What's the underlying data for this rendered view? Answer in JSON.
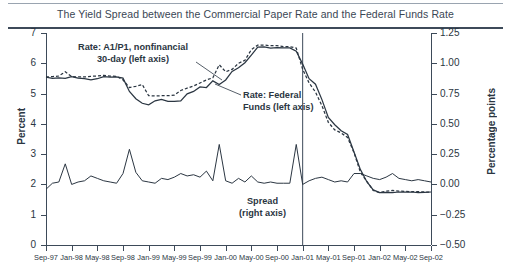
{
  "title": "The Yield Spread between the Commercial Paper Rate and the Federal Funds Rate",
  "axes": {
    "left_title": "Percent",
    "right_title": "Percentage points",
    "left_ticks": [
      "0",
      "1",
      "2",
      "3",
      "4",
      "5",
      "6",
      "7"
    ],
    "right_ticks": [
      "−0.50",
      "−0.25",
      "0.00",
      "0.25",
      "0.50",
      "0.75",
      "1.00",
      "1.25"
    ],
    "x_ticks": [
      "Sep-97",
      "Jan-98",
      "May-98",
      "Sep-98",
      "Jan-99",
      "May-99",
      "Sep-99",
      "Jan-00",
      "May-00",
      "Sep-00",
      "Jan-01",
      "May-01",
      "Sep-01",
      "Jan-02",
      "May-02",
      "Sep-02"
    ]
  },
  "annotations": {
    "cp_line1": "Rate: A1/P1, nonfinancial",
    "cp_line2": "30-day (left axis)",
    "ff_line1": "Rate: Federal",
    "ff_line2": "Funds (left axis)",
    "spread_line1": "Spread",
    "spread_line2": "(right axis)"
  },
  "colors": {
    "line": "#2b3642",
    "axis": "#3d4a59",
    "title": "#3a4654"
  },
  "chart_data": {
    "type": "line",
    "title": "The Yield Spread between the Commercial Paper Rate and the Federal Funds Rate",
    "xlabel": "",
    "ylabel": "Percent",
    "y2label": "Percentage points",
    "ylim": [
      0,
      7
    ],
    "y2lim": [
      -0.5,
      1.25
    ],
    "grid": false,
    "legend": "annotations-inline",
    "vline": {
      "x": "Jan-01",
      "label": ""
    },
    "x": [
      "Sep-97",
      "Oct-97",
      "Nov-97",
      "Dec-97",
      "Jan-98",
      "Feb-98",
      "Mar-98",
      "Apr-98",
      "May-98",
      "Jun-98",
      "Jul-98",
      "Aug-98",
      "Sep-98",
      "Oct-98",
      "Nov-98",
      "Dec-98",
      "Jan-99",
      "Feb-99",
      "Mar-99",
      "Apr-99",
      "May-99",
      "Jun-99",
      "Jul-99",
      "Aug-99",
      "Sep-99",
      "Oct-99",
      "Nov-99",
      "Dec-99",
      "Jan-00",
      "Feb-00",
      "Mar-00",
      "Apr-00",
      "May-00",
      "Jun-00",
      "Jul-00",
      "Aug-00",
      "Sep-00",
      "Oct-00",
      "Nov-00",
      "Dec-00",
      "Jan-01",
      "Feb-01",
      "Mar-01",
      "Apr-01",
      "May-01",
      "Jun-01",
      "Jul-01",
      "Aug-01",
      "Sep-01",
      "Oct-01",
      "Nov-01",
      "Dec-01",
      "Jan-02",
      "Feb-02",
      "Mar-02",
      "Apr-02",
      "May-02",
      "Jun-02",
      "Jul-02",
      "Aug-02",
      "Sep-02"
    ],
    "series": [
      {
        "name": "Rate: A1/P1, nonfinancial 30-day (left axis)",
        "style": "dashed",
        "axis": "left",
        "units": "percent",
        "values": [
          5.55,
          5.56,
          5.58,
          5.72,
          5.56,
          5.55,
          5.55,
          5.57,
          5.58,
          5.6,
          5.58,
          5.57,
          5.45,
          5.2,
          5.24,
          5.3,
          4.93,
          4.92,
          4.93,
          4.93,
          4.95,
          5.1,
          5.18,
          5.25,
          5.35,
          5.45,
          5.52,
          5.95,
          5.72,
          5.8,
          6.0,
          6.1,
          6.45,
          6.6,
          6.6,
          6.58,
          6.58,
          6.55,
          6.55,
          6.5,
          5.8,
          5.35,
          5.05,
          4.6,
          4.05,
          3.8,
          3.7,
          3.55,
          3.05,
          2.4,
          2.1,
          1.8,
          1.73,
          1.78,
          1.8,
          1.78,
          1.77,
          1.76,
          1.76,
          1.75,
          1.74
        ]
      },
      {
        "name": "Rate: Federal Funds (left axis)",
        "style": "solid",
        "axis": "left",
        "units": "percent",
        "values": [
          5.54,
          5.5,
          5.52,
          5.5,
          5.56,
          5.51,
          5.49,
          5.45,
          5.49,
          5.56,
          5.54,
          5.55,
          5.51,
          5.07,
          4.83,
          4.68,
          4.63,
          4.76,
          4.81,
          4.74,
          4.74,
          4.76,
          4.99,
          5.07,
          5.22,
          5.2,
          5.42,
          5.3,
          5.45,
          5.73,
          5.85,
          6.02,
          6.27,
          6.53,
          6.54,
          6.5,
          6.52,
          6.51,
          6.51,
          6.4,
          5.98,
          5.49,
          5.31,
          4.8,
          4.21,
          3.97,
          3.77,
          3.65,
          3.07,
          2.49,
          2.09,
          1.82,
          1.73,
          1.74,
          1.73,
          1.75,
          1.75,
          1.75,
          1.73,
          1.74,
          1.75
        ]
      },
      {
        "name": "Spread (right axis)",
        "style": "solid",
        "axis": "right",
        "units": "percentage points",
        "values": [
          -0.04,
          0.01,
          0.02,
          0.17,
          0.0,
          0.02,
          0.03,
          0.07,
          0.05,
          0.03,
          0.02,
          0.01,
          0.09,
          0.29,
          0.1,
          0.03,
          0.02,
          0.01,
          0.05,
          0.04,
          0.06,
          0.09,
          0.07,
          0.08,
          0.06,
          0.11,
          0.03,
          0.33,
          0.03,
          0.01,
          0.05,
          0.02,
          0.07,
          0.02,
          0.01,
          0.02,
          0.01,
          0.01,
          0.01,
          0.33,
          0.0,
          0.03,
          0.05,
          0.06,
          0.04,
          0.02,
          0.03,
          0.02,
          0.09,
          0.09,
          0.07,
          0.05,
          0.04,
          0.06,
          0.09,
          0.05,
          0.04,
          0.03,
          0.04,
          0.03,
          0.02
        ]
      }
    ]
  }
}
